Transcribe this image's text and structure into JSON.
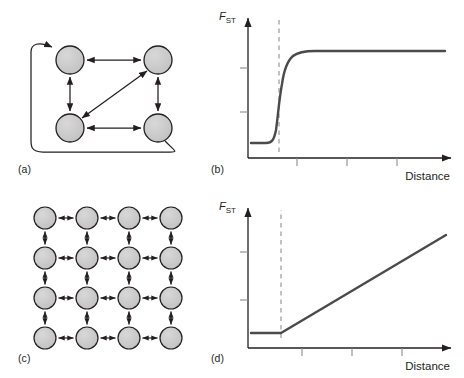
{
  "figure": {
    "panels": [
      {
        "id": "a",
        "label": "(a)",
        "type": "diagram",
        "name": "island-model-network"
      },
      {
        "id": "b",
        "label": "(b)",
        "type": "chart",
        "name": "island-model-fst-plot"
      },
      {
        "id": "c",
        "label": "(c)",
        "type": "diagram",
        "name": "stepping-stone-lattice"
      },
      {
        "id": "d",
        "label": "(d)",
        "type": "chart",
        "name": "stepping-stone-fst-plot"
      }
    ],
    "caption": "",
    "colors": {
      "node_fill": "#c9c9c9",
      "node_stroke": "#231f20",
      "arrow": "#231f20",
      "curve": "#4a4a4a",
      "axis": "#231f20",
      "dashed_guide": "#9a9a9a",
      "tick": "#8c8c8c"
    }
  },
  "panel_a": {
    "label": "(a)",
    "node_count": 4,
    "nodes": [
      {
        "id": "n1",
        "cx": 70,
        "cy": 60,
        "r": 14
      },
      {
        "id": "n2",
        "cx": 158,
        "cy": 60,
        "r": 14
      },
      {
        "id": "n3",
        "cx": 70,
        "cy": 128,
        "r": 14
      },
      {
        "id": "n4",
        "cx": 158,
        "cy": 128,
        "r": 14
      }
    ],
    "edges": [
      {
        "from": "n1",
        "to": "n2",
        "style": "double-arrow"
      },
      {
        "from": "n1",
        "to": "n3",
        "style": "double-arrow"
      },
      {
        "from": "n2",
        "to": "n4",
        "style": "double-arrow"
      },
      {
        "from": "n3",
        "to": "n4",
        "style": "double-arrow"
      },
      {
        "from": "n3",
        "to": "n2",
        "style": "double-arrow-diagonal"
      },
      {
        "from": "n4",
        "to": "n1",
        "style": "wrap-around-curve"
      }
    ]
  },
  "panel_c": {
    "label": "(c)",
    "grid_rows": 4,
    "grid_cols": 4,
    "node_radius": 11,
    "spacing_x": 42,
    "spacing_y": 40,
    "origin_x": 45,
    "origin_y": 28,
    "edge_style": "double-arrow"
  },
  "chart_data": [
    {
      "panel": "b",
      "name": "island-model-fst-plot",
      "type": "line",
      "title": "",
      "xlabel": "Distance",
      "ylabel": "FST",
      "ylabel_parts": {
        "base": "F",
        "subscript": "ST"
      },
      "xlim": [
        0,
        100
      ],
      "ylim": [
        0,
        100
      ],
      "grid": false,
      "legend": false,
      "description": "Sharp sigmoid: F-ST stays low then jumps to a high plateau at the threshold distance.",
      "x": [
        0,
        5,
        10,
        15,
        18,
        20,
        22,
        24,
        26,
        28,
        30,
        32,
        34,
        38,
        45,
        55,
        70,
        85,
        100
      ],
      "y": [
        12,
        12,
        12.5,
        14,
        16,
        20,
        28,
        42,
        58,
        70,
        78,
        82,
        84,
        85,
        85.5,
        85.5,
        85.5,
        85.5,
        85.5
      ],
      "annotations": [
        {
          "type": "vertical-dashed-line",
          "x": 24,
          "label": ""
        }
      ],
      "x_ticks": [
        35,
        56,
        77
      ],
      "y_ticks": [
        40,
        70
      ],
      "tick_labels_shown": false
    },
    {
      "panel": "d",
      "name": "stepping-stone-fst-plot",
      "type": "line",
      "title": "",
      "xlabel": "Distance",
      "ylabel": "FST",
      "ylabel_parts": {
        "base": "F",
        "subscript": "ST"
      },
      "xlim": [
        0,
        100
      ],
      "ylim": [
        0,
        100
      ],
      "grid": false,
      "legend": false,
      "description": "Flat plateau at low F-ST until the threshold, then a steady linear increase with distance.",
      "x": [
        0,
        10,
        20,
        24,
        40,
        60,
        80,
        95
      ],
      "y": [
        10,
        10,
        10,
        10,
        30,
        50,
        70,
        84
      ],
      "annotations": [
        {
          "type": "vertical-dashed-line",
          "x": 24,
          "label": ""
        }
      ],
      "x_ticks": [
        35,
        56,
        77
      ],
      "y_ticks": [
        40,
        70
      ],
      "tick_labels_shown": false
    }
  ]
}
